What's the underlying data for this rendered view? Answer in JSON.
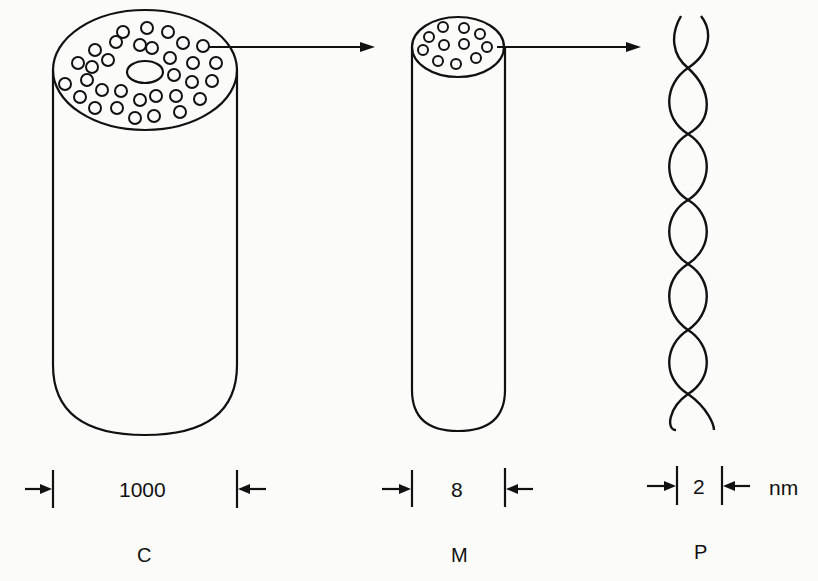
{
  "diagram": {
    "structures": [
      {
        "id": "C",
        "label": "C",
        "dimension": "1000",
        "description": "large cylinder with many inner fibrils in cross-section"
      },
      {
        "id": "M",
        "label": "M",
        "dimension": "8",
        "description": "medium cylinder with smaller fibrils in cross-section"
      },
      {
        "id": "P",
        "label": "P",
        "dimension": "2",
        "description": "twisted double strand"
      }
    ],
    "unit": "nm",
    "arrows": [
      "C-to-M",
      "M-to-P"
    ],
    "colors": {
      "stroke": "#111111",
      "background": "#fbfbfa"
    }
  }
}
